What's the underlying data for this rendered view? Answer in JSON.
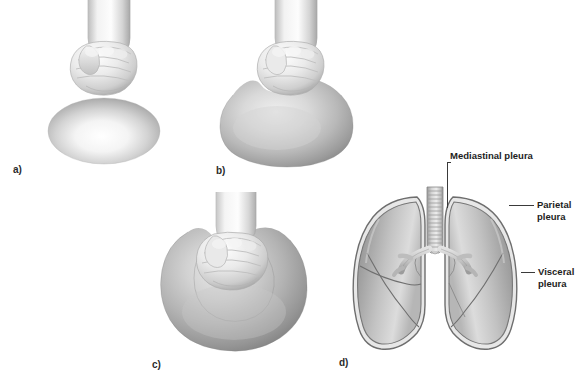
{
  "figure": {
    "background_color": "#ffffff"
  },
  "panels": [
    {
      "id": "a",
      "label": "a)",
      "description": "Fist held above an uncompressed balloon",
      "elements": [
        "fist",
        "balloon"
      ]
    },
    {
      "id": "b",
      "label": "b)",
      "description": "Fist beginning to press into the balloon",
      "elements": [
        "fist",
        "balloon-indented"
      ]
    },
    {
      "id": "c",
      "label": "c)",
      "description": "Fist fully enveloped by the balloon forming two layers",
      "elements": [
        "fist",
        "balloon-enveloping"
      ]
    },
    {
      "id": "d",
      "label": "d)",
      "description": "Anterior view of lungs, trachea and bronchi with pleural layers",
      "elements": [
        "trachea",
        "bronchi",
        "right-lung",
        "left-lung",
        "pleura-layers"
      ]
    }
  ],
  "callouts": [
    {
      "name": "mediastinal-pleura",
      "text": "Mediastinal pleura",
      "lines": [
        "Mediastinal pleura"
      ]
    },
    {
      "name": "parietal-pleura",
      "text": "Parietal pleura",
      "lines": [
        "Parietal",
        "pleura"
      ]
    },
    {
      "name": "visceral-pleura",
      "text": "Visceral pleura",
      "lines": [
        "Visceral",
        "pleura"
      ]
    }
  ],
  "colors": {
    "ink": "#1d1d1d",
    "leader": "#3a3a3a",
    "lung_fill_light": "#d6d6d6",
    "lung_fill_mid": "#a9a9a9",
    "lung_fill_dark": "#7e7e7e",
    "pleura_outline": "#6e6e6e",
    "balloon_light": "#fbfbfb",
    "balloon_mid": "#c4c4c4",
    "balloon_dark": "#8f8f8f",
    "skin_light": "#fdfdfd",
    "skin_mid": "#d8d8d8",
    "skin_shadow": "#9d9d9d"
  }
}
